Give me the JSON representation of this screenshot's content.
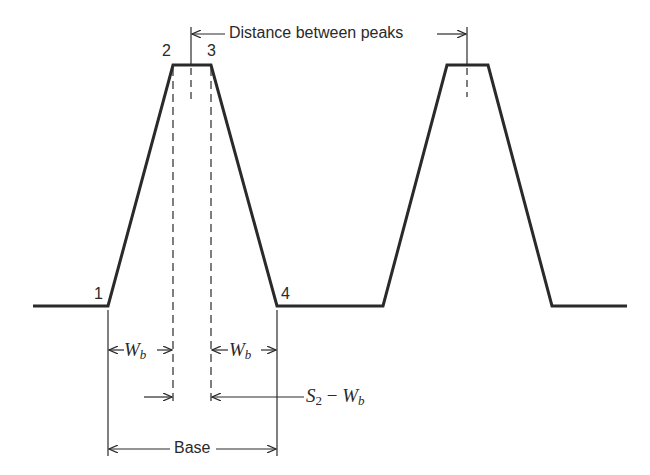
{
  "diagram": {
    "title": "",
    "point_labels": {
      "p1": "1",
      "p2": "2",
      "p3": "3",
      "p4": "4"
    },
    "labels": {
      "distance_between_peaks": "Distance between peaks",
      "wb_symbol": "W",
      "wb_subscript": "b",
      "s2_symbol": "S",
      "s2_subscript": "2",
      "minus": " − ",
      "base": "Base"
    },
    "colors": {
      "stroke": "#2a2a2a",
      "background": "#ffffff"
    }
  }
}
